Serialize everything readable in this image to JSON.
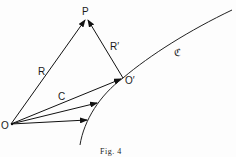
{
  "figure": {
    "caption": "Fig. 4",
    "points": {
      "origin": {
        "label": "O",
        "x": 11,
        "y": 124
      },
      "point_p": {
        "label": "P",
        "x": 86,
        "y": 18
      },
      "point_o_prime": {
        "label": "O′",
        "x": 123,
        "y": 78
      }
    },
    "vectors": [
      {
        "label": "R",
        "from": "O",
        "to": "P"
      },
      {
        "label": "R′",
        "from": "O′",
        "to": "P"
      },
      {
        "label": "C",
        "from": "O",
        "to": "O′"
      },
      {
        "label": "",
        "from": "O",
        "to": "curve point 2"
      },
      {
        "label": "",
        "from": "O",
        "to": "curve point 3"
      }
    ],
    "curve": {
      "label": "ℭ"
    }
  }
}
